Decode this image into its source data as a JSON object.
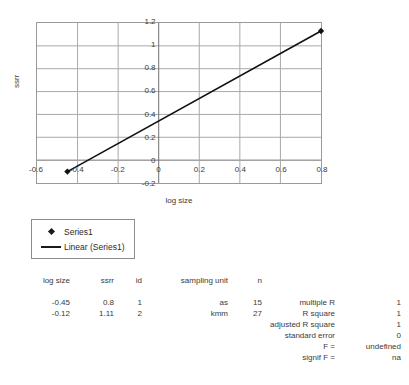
{
  "chart_data": {
    "type": "scatter",
    "title": "",
    "xlabel": "log size",
    "ylabel": "ssrr",
    "xlim": [
      -0.6,
      0.8
    ],
    "ylim": [
      -0.2,
      1.2
    ],
    "xticks": [
      "-0.6",
      "-0.4",
      "-0.2",
      "0",
      "0.2",
      "0.4",
      "0.6",
      "0.8"
    ],
    "xtick_values": [
      -0.6,
      -0.4,
      -0.2,
      0,
      0.2,
      0.4,
      0.6,
      0.8
    ],
    "yticks": [
      "-0.2",
      "0",
      "0.2",
      "0.4",
      "0.6",
      "0.8",
      "1",
      "1.2"
    ],
    "ytick_values": [
      -0.2,
      0,
      0.2,
      0.4,
      0.6,
      0.8,
      1,
      1.2
    ],
    "grid": true,
    "legend_position": "below-left",
    "series": [
      {
        "name": "Series1",
        "marker": "diamond",
        "x": [
          -0.45,
          -0.12
        ],
        "y": [
          0.8,
          1.11
        ]
      },
      {
        "name": "Linear (Series1)",
        "marker": "line",
        "trendline_from": [
          -0.45,
          -0.1
        ],
        "trendline_to": [
          0.8,
          1.13
        ]
      }
    ],
    "plotted_points": [
      {
        "x": -0.45,
        "y": -0.1
      },
      {
        "x": 0.8,
        "y": 1.13
      }
    ]
  },
  "legend": {
    "items": [
      {
        "label": "Series1",
        "key": "diamond"
      },
      {
        "label": "Linear (Series1)",
        "key": "line"
      }
    ]
  },
  "data_table": {
    "headers": [
      "log size",
      "ssrr",
      "id",
      "sampling unit",
      "n"
    ],
    "rows": [
      [
        "-0.45",
        "0.8",
        "1",
        "as",
        "15"
      ],
      [
        "-0.12",
        "1.11",
        "2",
        "kmm",
        "27"
      ]
    ]
  },
  "stats": {
    "rows": [
      {
        "label": "multiple R",
        "value": "1"
      },
      {
        "label": "R square",
        "value": "1"
      },
      {
        "label": "adjusted R square",
        "value": "1"
      },
      {
        "label": "standard error",
        "value": "0"
      },
      {
        "label": "F =",
        "value": "undefined"
      },
      {
        "label": "signif F =",
        "value": "na"
      }
    ]
  }
}
